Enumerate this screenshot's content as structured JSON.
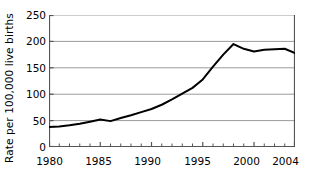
{
  "chart_data": {
    "type": "line",
    "title": "",
    "subtitle": "",
    "xlabel": "",
    "ylabel": "Rate per 100,000 live births",
    "xlim": [
      1980,
      2004
    ],
    "ylim": [
      0,
      250
    ],
    "grid": true,
    "legend": false,
    "legend_position": "none",
    "x_tick_labels": [
      "1980",
      "1985",
      "1990",
      "1995",
      "2000",
      "2004"
    ],
    "x_tick_values": [
      1980,
      1985,
      1990,
      1995,
      2000,
      2004
    ],
    "y_tick_labels": [
      "0",
      "50",
      "100",
      "150",
      "200",
      "250"
    ],
    "y_tick_values": [
      0,
      50,
      100,
      150,
      200,
      250
    ],
    "x": [
      1980,
      1981,
      1982,
      1983,
      1984,
      1985,
      1986,
      1987,
      1988,
      1989,
      1990,
      1991,
      1992,
      1993,
      1994,
      1995,
      1996,
      1997,
      1998,
      1999,
      2000,
      2001,
      2002,
      2003,
      2004
    ],
    "series": [
      {
        "name": "Rate per 100,000 live births",
        "color": "#000000",
        "values": [
          38,
          39,
          41,
          44,
          48,
          52,
          49,
          55,
          60,
          66,
          72,
          80,
          90,
          101,
          112,
          128,
          152,
          175,
          195,
          186,
          181,
          184,
          185,
          186,
          178
        ]
      }
    ]
  },
  "axes": {
    "y_title": "Rate per 100,000 live births"
  },
  "style": {
    "line_color": "#000000",
    "grid_color": "#9a9a9a",
    "axis_color": "#555555",
    "background": "#ffffff"
  }
}
